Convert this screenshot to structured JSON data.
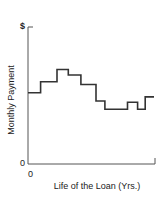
{
  "chart_data": {
    "type": "line",
    "subtype": "step",
    "title": "",
    "xlabel": "Life of the Loan (Yrs.)",
    "ylabel": "Monthly Payment",
    "y_top_label": "$",
    "y_origin_label": "0",
    "x_origin_label": "0",
    "grid": false,
    "legend": null,
    "xlim": [
      0,
      1
    ],
    "ylim": [
      0,
      1
    ],
    "series": [
      {
        "name": "Monthly Payment",
        "steps": [
          {
            "x_start": 0.0,
            "x_end": 0.1,
            "y": 0.52
          },
          {
            "x_start": 0.1,
            "x_end": 0.23,
            "y": 0.6
          },
          {
            "x_start": 0.23,
            "x_end": 0.32,
            "y": 0.69
          },
          {
            "x_start": 0.32,
            "x_end": 0.42,
            "y": 0.65
          },
          {
            "x_start": 0.42,
            "x_end": 0.54,
            "y": 0.58
          },
          {
            "x_start": 0.54,
            "x_end": 0.61,
            "y": 0.46
          },
          {
            "x_start": 0.61,
            "x_end": 0.79,
            "y": 0.4
          },
          {
            "x_start": 0.79,
            "x_end": 0.87,
            "y": 0.45
          },
          {
            "x_start": 0.87,
            "x_end": 0.93,
            "y": 0.4
          },
          {
            "x_start": 0.93,
            "x_end": 1.0,
            "y": 0.49
          }
        ]
      }
    ],
    "note": "Unitless schematic; values are relative fractions of axis range."
  },
  "labels": {
    "y_top": "$",
    "y_zero": "0",
    "x_zero": "0",
    "y_axis": "Monthly Payment",
    "x_axis": "Life of the Loan (Yrs.)"
  },
  "colors": {
    "axis": "#555555",
    "line": "#333333"
  }
}
